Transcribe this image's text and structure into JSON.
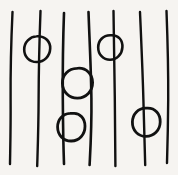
{
  "figure": {
    "width": 178,
    "height": 175,
    "background_color": "#f6f4f1",
    "ink_color": "#111111"
  },
  "drawing": {
    "lines": [
      {
        "name": "vertical-line-1",
        "stroke_width": 2.4,
        "path": "M 12.5 12 C 11.2 40, 10.4 70, 10.6 100 C 10.8 128, 10.2 150, 10.0 164"
      },
      {
        "name": "vertical-line-2",
        "stroke_width": 2.4,
        "path": "M 40.5 11 C 39.4 40, 38.7 70, 38.6 100 C 38.5 128, 37.6 152, 37.2 166"
      },
      {
        "name": "vertical-line-3",
        "stroke_width": 2.6,
        "path": "M 64.0 13 C 63.0 40, 62.6 68, 62.8 98 C 63.0 126, 63.5 150, 64.0 164"
      },
      {
        "name": "vertical-line-4",
        "stroke_width": 2.6,
        "path": "M 88.5 12 C 89.5 40, 91.0 68, 91.4 98 C 91.8 126, 90.4 150, 89.6 165"
      },
      {
        "name": "vertical-line-5",
        "stroke_width": 2.4,
        "path": "M 113.5 11 C 113.8 40, 114.6 68, 114.8 98 C 115.0 126, 115.2 152, 115.4 166"
      },
      {
        "name": "vertical-line-6",
        "stroke_width": 2.4,
        "path": "M 140.0 12 C 141.2 40, 142.6 70, 143.4 100 C 144.2 128, 144.8 152, 145.2 165"
      },
      {
        "name": "vertical-line-7",
        "stroke_width": 2.4,
        "path": "M 166.5 11 C 167.6 40, 168.4 70, 168.2 100 C 168.0 128, 167.4 150, 167.0 163"
      }
    ],
    "circles": [
      {
        "name": "circle-on-line-2-upper",
        "stroke_width": 2.6,
        "center": [
          37,
          49
        ],
        "radius": 13,
        "path": "M 38.5 36.2 C 45.6 36.6, 50.6 41.8, 50.2 48.6 C 49.8 56.2, 44.4 61.8, 37.0 62.0 C 29.6 62.2, 24.2 56.8, 24.2 49.4 C 24.2 42.2, 29.8 36.8, 36.6 36.3 C 37.0 36.25, 37.8 36.2, 38.5 36.2 Z"
      },
      {
        "name": "circle-on-lines-3-4-middle",
        "stroke_width": 2.8,
        "center": [
          77,
          83
        ],
        "radius": 15,
        "path": "M 78.5 68.2 C 86.6 68.0, 92.6 74.4, 92.6 82.6 C 92.6 91.2, 86.2 98.0, 77.6 98.2 C 69.2 98.4, 62.6 91.8, 62.4 83.2 C 62.2 74.8, 68.6 68.6, 76.8 68.3 C 77.3 68.25, 78.0 68.2, 78.5 68.2 Z"
      },
      {
        "name": "circle-on-line-3-lower",
        "stroke_width": 2.8,
        "center": [
          71,
          127
        ],
        "radius": 14,
        "path": "M 73.5 113.4 C 80.0 113.0, 85.0 118.6, 85.0 126.2 C 85.0 134.6, 79.2 140.8, 71.4 141.0 C 63.6 141.2, 57.6 135.2, 57.6 127.0 C 57.6 119.4, 62.8 113.8, 70.0 113.4 C 71.2 113.3, 72.6 113.35, 73.5 113.4 Z"
      },
      {
        "name": "circle-on-line-5-upper",
        "stroke_width": 2.6,
        "center": [
          110,
          47
        ],
        "radius": 12,
        "path": "M 111.6 35.2 C 118.4 35.0, 122.8 40.2, 122.4 47.2 C 122.0 54.4, 116.8 59.8, 110.0 59.8 C 103.2 59.8, 98.2 54.4, 98.2 47.4 C 98.2 40.4, 103.2 35.4, 110.2 35.2 C 110.6 35.18, 111.2 35.2, 111.6 35.2 Z"
      },
      {
        "name": "circle-on-line-6-lower",
        "stroke_width": 2.8,
        "center": [
          146,
          122
        ],
        "radius": 14,
        "path": "M 147.4 108.2 C 155.2 108.0, 160.4 114.0, 160.2 122.0 C 160.0 130.4, 154.0 136.4, 146.0 136.4 C 138.0 136.4, 132.2 130.4, 132.4 122.0 C 132.6 114.2, 138.0 108.4, 145.6 108.2 C 146.2 108.18, 146.9 108.2, 147.4 108.2 Z"
      }
    ]
  }
}
